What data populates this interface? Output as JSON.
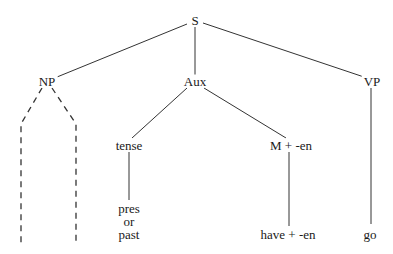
{
  "diagram": {
    "type": "syntax-tree",
    "nodes": {
      "root": {
        "label": "S",
        "x": 195,
        "y": 20
      },
      "np": {
        "label": "NP",
        "x": 47,
        "y": 81
      },
      "aux": {
        "label": "Aux",
        "x": 195,
        "y": 81
      },
      "vp": {
        "label": "VP",
        "x": 372,
        "y": 81
      },
      "tense": {
        "label": "tense",
        "x": 129,
        "y": 145
      },
      "m_en": {
        "label": "M + -en",
        "x": 291,
        "y": 145
      },
      "tense_value": {
        "lines": [
          "pres",
          "or",
          "past"
        ],
        "x": 129,
        "y": 221
      },
      "have_en": {
        "label": "have + -en",
        "x": 288,
        "y": 234
      },
      "go": {
        "label": "go",
        "x": 370,
        "y": 234
      }
    },
    "edges": [
      {
        "from": "root",
        "to": "np",
        "style": "solid"
      },
      {
        "from": "root",
        "to": "aux",
        "style": "solid"
      },
      {
        "from": "root",
        "to": "vp",
        "style": "solid"
      },
      {
        "from": "aux",
        "to": "tense",
        "style": "solid"
      },
      {
        "from": "aux",
        "to": "m_en",
        "style": "solid"
      },
      {
        "from": "tense",
        "to": "tense_value",
        "style": "solid"
      },
      {
        "from": "m_en",
        "to": "have_en",
        "style": "solid"
      },
      {
        "from": "vp",
        "to": "go",
        "style": "solid"
      },
      {
        "from": "np",
        "to": "np_left_branch",
        "style": "dashed"
      },
      {
        "from": "np",
        "to": "np_right_branch",
        "style": "dashed"
      }
    ],
    "line_color": "#333333"
  }
}
